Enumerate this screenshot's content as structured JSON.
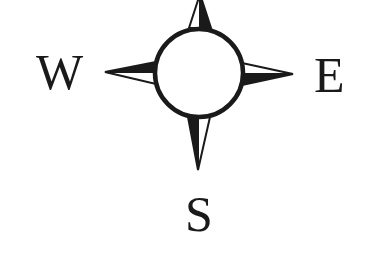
{
  "compass": {
    "labels": {
      "west": "W",
      "east": "E",
      "south": "S"
    },
    "colors": {
      "ink": "#1a1a1a",
      "fill_light": "#ffffff",
      "background": "#ffffff"
    },
    "icon": "compass-rose-icon"
  }
}
